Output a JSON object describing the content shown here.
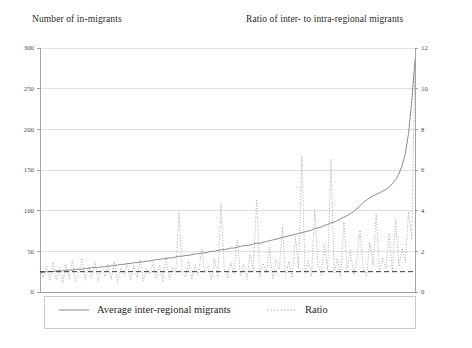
{
  "titles": {
    "left_axis": "Number of in-migrants",
    "right_axis": "Ratio of inter- to intra-regional migrants"
  },
  "legend": {
    "average_label": "Average inter-regional migrants",
    "ratio_label": "Ratio"
  },
  "colors": {
    "average_line": "#8c8c8c",
    "ratio_line": "#9a9a9a",
    "reference_line": "#3a3a3a",
    "grid": "#d8d8d8",
    "axis": "#9a9a9a",
    "text": "#1f1f1f"
  },
  "chart_data": {
    "type": "line",
    "title": "",
    "xlabel": "",
    "ylabel": "Number of in-migrants",
    "y2label": "Ratio of inter- to intra-regional migrants",
    "ylim": [
      0,
      300
    ],
    "y2lim": [
      0,
      12
    ],
    "yticks": [
      0,
      50,
      100,
      150,
      200,
      250,
      300
    ],
    "y2ticks": [
      0,
      2,
      4,
      6,
      8,
      10,
      12
    ],
    "ytick_labels": [
      "0",
      "50",
      "100",
      "150",
      "200",
      "250",
      "300"
    ],
    "y2tick_labels": [
      "0",
      "2",
      "4",
      "6",
      "8",
      "10",
      "12"
    ],
    "xticks": [],
    "xtick_labels": [],
    "grid": true,
    "legend_position": "bottom",
    "reference_line": {
      "axis": "y2",
      "value": 1.0,
      "style": "dashed",
      "label": ""
    },
    "series": [
      {
        "name": "Average inter-regional migrants",
        "axis": "y1",
        "style": "solid",
        "values": [
          24,
          24,
          25,
          25,
          25,
          26,
          26,
          26,
          27,
          27,
          27,
          28,
          28,
          28,
          29,
          29,
          30,
          30,
          30,
          31,
          31,
          32,
          32,
          33,
          33,
          34,
          34,
          35,
          35,
          36,
          36,
          37,
          37,
          38,
          38,
          39,
          40,
          40,
          41,
          41,
          42,
          42,
          43,
          44,
          44,
          45,
          45,
          46,
          47,
          47,
          48,
          48,
          49,
          50,
          50,
          51,
          52,
          52,
          53,
          54,
          54,
          55,
          56,
          57,
          57,
          58,
          59,
          60,
          60,
          61,
          62,
          63,
          64,
          65,
          66,
          67,
          68,
          69,
          70,
          71,
          72,
          73,
          74,
          75,
          76,
          78,
          79,
          80,
          82,
          83,
          85,
          86,
          88,
          90,
          92,
          94,
          96,
          99,
          102,
          106,
          110,
          113,
          116,
          118,
          120,
          122,
          124,
          126,
          129,
          133,
          138,
          145,
          155,
          170,
          195,
          235,
          285
        ]
      },
      {
        "name": "Ratio",
        "axis": "y2",
        "style": "dotted",
        "values": [
          1.05,
          0.72,
          1.3,
          0.55,
          1.45,
          0.6,
          1.2,
          0.45,
          1.38,
          0.62,
          1.55,
          0.5,
          0.95,
          1.65,
          0.58,
          1.25,
          0.7,
          1.48,
          0.52,
          1.1,
          0.78,
          1.35,
          0.62,
          1.52,
          0.48,
          1.18,
          0.82,
          1.42,
          0.58,
          1.28,
          0.7,
          1.6,
          0.55,
          1.15,
          0.88,
          1.45,
          0.65,
          1.32,
          0.5,
          1.72,
          0.6,
          1.22,
          0.95,
          3.95,
          1.05,
          0.72,
          1.5,
          0.62,
          1.38,
          0.85,
          2.1,
          0.95,
          1.28,
          0.58,
          1.62,
          0.75,
          4.35,
          1.1,
          0.68,
          1.45,
          0.92,
          2.55,
          0.8,
          1.35,
          0.62,
          1.85,
          1.05,
          4.55,
          0.75,
          1.4,
          0.95,
          2.2,
          0.65,
          1.58,
          1.12,
          3.2,
          0.85,
          1.48,
          0.7,
          2.7,
          1.15,
          6.7,
          0.92,
          1.55,
          0.78,
          4.05,
          1.25,
          0.85,
          2.35,
          1.05,
          6.55,
          0.95,
          1.65,
          0.72,
          3.45,
          1.18,
          2.05,
          0.88,
          1.52,
          3.05,
          1.1,
          0.78,
          2.45,
          1.3,
          3.85,
          0.95,
          1.68,
          1.15,
          2.9,
          1.05,
          3.6,
          1.25,
          2.15,
          1.45,
          3.95,
          2.6,
          11.55
        ]
      }
    ]
  }
}
